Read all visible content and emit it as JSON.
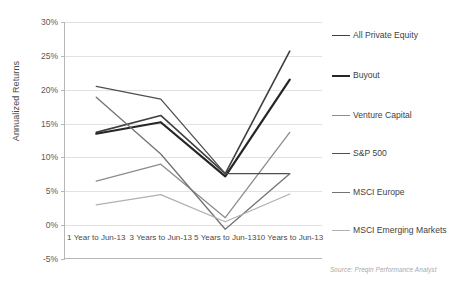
{
  "chart_data": {
    "type": "line",
    "title": "",
    "xlabel": "",
    "ylabel": "Annualized Returns",
    "categories": [
      "1 Year to Jun-13",
      "3 Years to Jun-13",
      "5 Years to Jun-13",
      "10 Years to Jun-13"
    ],
    "ylim": [
      -5,
      30
    ],
    "ytick_labels": [
      "30%",
      "25%",
      "20%",
      "15%",
      "10%",
      "5%",
      "0%",
      "-5%"
    ],
    "ytick_values": [
      30,
      25,
      20,
      15,
      10,
      5,
      0,
      -5
    ],
    "grid": true,
    "legend_position": "right",
    "series": [
      {
        "name": "All Private Equity",
        "values": [
          13.7,
          16.2,
          7.6,
          25.7
        ],
        "color": "#3f3f3f",
        "width": 1.6
      },
      {
        "name": "Buyout",
        "values": [
          13.5,
          15.2,
          7.2,
          21.5
        ],
        "color": "#262626",
        "width": 2.2
      },
      {
        "name": "Venture Capital",
        "values": [
          6.5,
          9.0,
          1.1,
          13.7
        ],
        "color": "#8c8c8c",
        "width": 1.3
      },
      {
        "name": "S&P 500",
        "values": [
          20.5,
          18.6,
          7.6,
          7.6
        ],
        "color": "#4f4f4f",
        "width": 1.3
      },
      {
        "name": "MSCI Europe",
        "values": [
          18.9,
          10.5,
          -0.6,
          7.6
        ],
        "color": "#737373",
        "width": 1.3
      },
      {
        "name": "MSCI Emerging Markets",
        "values": [
          3.0,
          4.5,
          0.5,
          4.6
        ],
        "color": "#b0b0b0",
        "width": 1.3
      }
    ],
    "source_note": "Source: Preqin Performance Analyst"
  }
}
